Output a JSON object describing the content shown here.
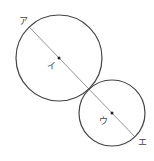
{
  "diagram": {
    "type": "two tangent circles with line through centers",
    "labels": {
      "a": "ア",
      "i": "イ",
      "u": "ウ",
      "e": "エ"
    },
    "large_circle": {
      "cx": 59,
      "cy": 58,
      "r": 43,
      "center_label": "イ"
    },
    "small_circle": {
      "cx": 112,
      "cy": 113,
      "r": 33,
      "center_label": "ウ"
    },
    "line": {
      "from_label": "ア",
      "to_label": "エ",
      "x1": 29.2,
      "y1": 27.0,
      "x2": 134.9,
      "y2": 136.8
    },
    "colors": {
      "circle_stroke": "#444444",
      "line_stroke": "#888888",
      "dot": "#222222",
      "background": "#ffffff"
    }
  }
}
